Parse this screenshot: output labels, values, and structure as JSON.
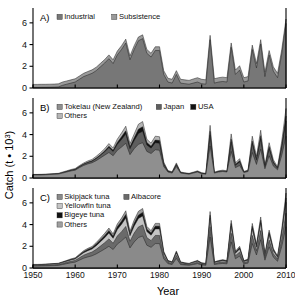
{
  "figure": {
    "xlabel": "Year",
    "ylabel": "Catch (t • 10³)",
    "ylabel_base": "Catch (t • 10",
    "ylabel_sup": "3",
    "ylabel_close": ")",
    "xticks": [
      "1950",
      "1960",
      "1970",
      "1980",
      "1990",
      "2000",
      "2010"
    ],
    "yticks": [
      "0",
      "2",
      "4",
      "6"
    ],
    "xlim": [
      1950,
      2010
    ],
    "ylim": [
      0,
      7
    ],
    "panel_labels": [
      "A)",
      "B)",
      "C)"
    ]
  },
  "colors": {
    "dark": "#111111",
    "mid_dark": "#555555",
    "mid": "#777777",
    "mid_light": "#9a9a9a",
    "light": "#bfbfbf",
    "lighter": "#d8d8d8",
    "axis": "#000000",
    "background": "#ffffff"
  },
  "chart_data": [
    {
      "type": "area",
      "panel": "A)",
      "title": "",
      "xlabel": "Year",
      "ylabel": "Catch (t • 10³)",
      "xlim": [
        1950,
        2010
      ],
      "ylim": [
        0,
        7
      ],
      "stacked": true,
      "grid": false,
      "legend_position": "top-left",
      "legend": [
        "Industrial",
        "Subsistence"
      ],
      "x": [
        1950,
        1951,
        1952,
        1953,
        1954,
        1955,
        1956,
        1957,
        1958,
        1959,
        1960,
        1961,
        1962,
        1963,
        1964,
        1965,
        1966,
        1967,
        1968,
        1969,
        1970,
        1971,
        1972,
        1973,
        1974,
        1975,
        1976,
        1977,
        1978,
        1979,
        1980,
        1981,
        1982,
        1983,
        1984,
        1985,
        1986,
        1987,
        1988,
        1989,
        1990,
        1991,
        1992,
        1993,
        1994,
        1995,
        1996,
        1997,
        1998,
        1999,
        2000,
        2001,
        2002,
        2003,
        2004,
        2005,
        2006,
        2007,
        2008,
        2009,
        2010
      ],
      "series": [
        {
          "name": "Industrial",
          "color": "#777777",
          "values": [
            0.05,
            0.05,
            0.06,
            0.06,
            0.07,
            0.08,
            0.1,
            0.25,
            0.35,
            0.45,
            0.55,
            0.8,
            1.05,
            1.2,
            1.35,
            1.6,
            1.95,
            2.3,
            2.7,
            2.25,
            3.05,
            3.55,
            4.15,
            2.6,
            3.55,
            4.35,
            4.55,
            3.2,
            2.85,
            3.45,
            3.45,
            1.25,
            0.55,
            0.45,
            1.25,
            0.45,
            0.4,
            0.35,
            0.45,
            0.55,
            0.4,
            0.35,
            4.45,
            0.45,
            0.55,
            0.6,
            0.55,
            3.75,
            1.25,
            1.65,
            0.55,
            0.65,
            3.55,
            1.85,
            4.05,
            1.05,
            3.05,
            1.55,
            0.95,
            3.15,
            5.95
          ]
        },
        {
          "name": "Subsistence",
          "color": "#9a9a9a",
          "values": [
            0.28,
            0.28,
            0.28,
            0.28,
            0.28,
            0.28,
            0.28,
            0.3,
            0.3,
            0.3,
            0.3,
            0.3,
            0.3,
            0.32,
            0.32,
            0.32,
            0.32,
            0.32,
            0.35,
            0.35,
            0.35,
            0.35,
            0.35,
            0.35,
            0.35,
            0.35,
            0.35,
            0.35,
            0.35,
            0.35,
            0.35,
            0.35,
            0.35,
            0.35,
            0.35,
            0.35,
            0.35,
            0.35,
            0.38,
            0.4,
            0.4,
            0.4,
            0.4,
            0.4,
            0.4,
            0.4,
            0.4,
            0.4,
            0.4,
            0.4,
            0.4,
            0.4,
            0.4,
            0.4,
            0.4,
            0.4,
            0.4,
            0.4,
            0.4,
            0.4,
            0.4
          ]
        }
      ]
    },
    {
      "type": "area",
      "panel": "B)",
      "title": "",
      "xlabel": "Year",
      "ylabel": "Catch (t • 10³)",
      "xlim": [
        1950,
        2010
      ],
      "ylim": [
        0,
        7
      ],
      "stacked": true,
      "grid": false,
      "legend_position": "top-left",
      "legend": [
        "Tokelau (New Zealand)",
        "Japan",
        "USA",
        "Others"
      ],
      "x": [
        1950,
        1951,
        1952,
        1953,
        1954,
        1955,
        1956,
        1957,
        1958,
        1959,
        1960,
        1961,
        1962,
        1963,
        1964,
        1965,
        1966,
        1967,
        1968,
        1969,
        1970,
        1971,
        1972,
        1973,
        1974,
        1975,
        1976,
        1977,
        1978,
        1979,
        1980,
        1981,
        1982,
        1983,
        1984,
        1985,
        1986,
        1987,
        1988,
        1989,
        1990,
        1991,
        1992,
        1993,
        1994,
        1995,
        1996,
        1997,
        1998,
        1999,
        2000,
        2001,
        2002,
        2003,
        2004,
        2005,
        2006,
        2007,
        2008,
        2009,
        2010
      ],
      "series": [
        {
          "name": "Tokelau (New Zealand)",
          "color": "#8f8f8f",
          "values": [
            0.28,
            0.28,
            0.28,
            0.3,
            0.32,
            0.34,
            0.36,
            0.45,
            0.55,
            0.65,
            0.72,
            0.95,
            1.15,
            1.3,
            1.4,
            1.6,
            1.85,
            2.1,
            2.35,
            2.05,
            2.55,
            2.85,
            3.2,
            2.15,
            2.7,
            3.1,
            3.25,
            2.45,
            2.25,
            2.6,
            2.55,
            1.05,
            0.55,
            0.45,
            1.05,
            0.45,
            0.4,
            0.35,
            0.45,
            0.55,
            0.4,
            0.35,
            2.95,
            0.45,
            0.55,
            0.6,
            0.55,
            2.45,
            0.95,
            1.15,
            0.5,
            0.6,
            2.35,
            1.25,
            2.65,
            0.85,
            2.05,
            1.1,
            0.75,
            2.1,
            3.85
          ]
        },
        {
          "name": "Japan",
          "color": "#5e5e5e",
          "values": [
            0.02,
            0.02,
            0.02,
            0.02,
            0.02,
            0.02,
            0.02,
            0.04,
            0.05,
            0.06,
            0.07,
            0.09,
            0.11,
            0.13,
            0.15,
            0.2,
            0.25,
            0.32,
            0.45,
            0.4,
            0.55,
            0.7,
            0.85,
            0.55,
            0.75,
            1.0,
            1.05,
            0.6,
            0.5,
            0.65,
            0.65,
            0.2,
            0.06,
            0.05,
            0.16,
            0.04,
            0.03,
            0.03,
            0.03,
            0.04,
            0.03,
            0.03,
            1.0,
            0.03,
            0.04,
            0.04,
            0.04,
            0.85,
            0.22,
            0.33,
            0.04,
            0.05,
            0.8,
            0.4,
            0.95,
            0.15,
            0.65,
            0.3,
            0.14,
            0.7,
            1.4
          ]
        },
        {
          "name": "USA",
          "color": "#111111",
          "values": [
            0.0,
            0.0,
            0.0,
            0.0,
            0.0,
            0.0,
            0.0,
            0.0,
            0.0,
            0.0,
            0.01,
            0.01,
            0.02,
            0.02,
            0.03,
            0.04,
            0.05,
            0.07,
            0.12,
            0.1,
            0.18,
            0.25,
            0.3,
            0.18,
            0.25,
            0.4,
            0.42,
            0.22,
            0.18,
            0.25,
            0.25,
            0.08,
            0.02,
            0.02,
            0.06,
            0.01,
            0.01,
            0.01,
            0.01,
            0.01,
            0.01,
            0.01,
            0.35,
            0.01,
            0.01,
            0.01,
            0.01,
            0.28,
            0.07,
            0.1,
            0.01,
            0.02,
            0.25,
            0.12,
            0.3,
            0.05,
            0.2,
            0.1,
            0.04,
            0.22,
            0.45
          ]
        },
        {
          "name": "Others",
          "color": "#b5b5b5",
          "values": [
            0.03,
            0.03,
            0.04,
            0.04,
            0.04,
            0.05,
            0.05,
            0.06,
            0.06,
            0.07,
            0.07,
            0.09,
            0.1,
            0.12,
            0.13,
            0.16,
            0.18,
            0.21,
            0.25,
            0.22,
            0.3,
            0.35,
            0.42,
            0.28,
            0.35,
            0.45,
            0.48,
            0.3,
            0.28,
            0.35,
            0.35,
            0.15,
            0.06,
            0.05,
            0.12,
            0.05,
            0.04,
            0.04,
            0.05,
            0.06,
            0.05,
            0.04,
            0.55,
            0.05,
            0.06,
            0.07,
            0.06,
            0.48,
            0.15,
            0.2,
            0.06,
            0.07,
            0.45,
            0.22,
            0.5,
            0.12,
            0.35,
            0.18,
            0.1,
            0.38,
            0.7
          ]
        }
      ]
    },
    {
      "type": "area",
      "panel": "C)",
      "title": "",
      "xlabel": "Year",
      "ylabel": "Catch (t • 10³)",
      "xlim": [
        1950,
        2010
      ],
      "ylim": [
        0,
        7
      ],
      "stacked": true,
      "grid": false,
      "legend_position": "top-left",
      "legend": [
        "Skipjack tuna",
        "Albacore",
        "Yellowfin tuna",
        "Bigeye tuna",
        "Others"
      ],
      "x": [
        1950,
        1951,
        1952,
        1953,
        1954,
        1955,
        1956,
        1957,
        1958,
        1959,
        1960,
        1961,
        1962,
        1963,
        1964,
        1965,
        1966,
        1967,
        1968,
        1969,
        1970,
        1971,
        1972,
        1973,
        1974,
        1975,
        1976,
        1977,
        1978,
        1979,
        1980,
        1981,
        1982,
        1983,
        1984,
        1985,
        1986,
        1987,
        1988,
        1989,
        1990,
        1991,
        1992,
        1993,
        1994,
        1995,
        1996,
        1997,
        1998,
        1999,
        2000,
        2001,
        2002,
        2003,
        2004,
        2005,
        2006,
        2007,
        2008,
        2009,
        2010
      ],
      "series": [
        {
          "name": "Skipjack tuna",
          "color": "#8a8a8a",
          "values": [
            0.18,
            0.18,
            0.19,
            0.2,
            0.21,
            0.22,
            0.24,
            0.32,
            0.4,
            0.48,
            0.54,
            0.72,
            0.9,
            1.02,
            1.12,
            1.3,
            1.52,
            1.75,
            2.0,
            1.7,
            2.2,
            2.5,
            2.85,
            1.85,
            2.4,
            2.8,
            2.95,
            2.1,
            1.9,
            2.25,
            2.25,
            0.85,
            0.4,
            0.32,
            0.88,
            0.32,
            0.28,
            0.25,
            0.32,
            0.4,
            0.28,
            0.25,
            2.85,
            0.32,
            0.38,
            0.42,
            0.38,
            2.4,
            0.85,
            1.1,
            0.38,
            0.45,
            2.25,
            1.2,
            2.6,
            0.72,
            1.95,
            1.0,
            0.62,
            2.0,
            3.8
          ]
        },
        {
          "name": "Albacore",
          "color": "#6a6a6a",
          "values": [
            0.06,
            0.06,
            0.06,
            0.07,
            0.07,
            0.08,
            0.08,
            0.1,
            0.12,
            0.14,
            0.16,
            0.22,
            0.28,
            0.32,
            0.35,
            0.42,
            0.5,
            0.58,
            0.68,
            0.58,
            0.75,
            0.85,
            0.98,
            0.62,
            0.82,
            0.98,
            1.02,
            0.7,
            0.62,
            0.75,
            0.75,
            0.28,
            0.12,
            0.1,
            0.28,
            0.1,
            0.08,
            0.07,
            0.1,
            0.12,
            0.08,
            0.07,
            0.95,
            0.1,
            0.12,
            0.14,
            0.12,
            0.8,
            0.28,
            0.36,
            0.12,
            0.15,
            0.75,
            0.4,
            0.85,
            0.22,
            0.62,
            0.32,
            0.2,
            0.65,
            1.25
          ]
        },
        {
          "name": "Yellowfin tuna",
          "color": "#c4c4c4",
          "values": [
            0.05,
            0.05,
            0.05,
            0.05,
            0.06,
            0.06,
            0.06,
            0.08,
            0.1,
            0.12,
            0.13,
            0.18,
            0.22,
            0.26,
            0.28,
            0.34,
            0.4,
            0.46,
            0.54,
            0.46,
            0.6,
            0.68,
            0.78,
            0.5,
            0.65,
            0.78,
            0.82,
            0.56,
            0.5,
            0.6,
            0.6,
            0.22,
            0.1,
            0.08,
            0.22,
            0.08,
            0.06,
            0.06,
            0.08,
            0.1,
            0.06,
            0.06,
            0.76,
            0.08,
            0.1,
            0.11,
            0.1,
            0.64,
            0.22,
            0.29,
            0.1,
            0.12,
            0.6,
            0.32,
            0.68,
            0.18,
            0.5,
            0.26,
            0.16,
            0.52,
            1.0
          ]
        },
        {
          "name": "Bigeye tuna",
          "color": "#111111",
          "values": [
            0.02,
            0.02,
            0.02,
            0.02,
            0.02,
            0.02,
            0.03,
            0.03,
            0.04,
            0.05,
            0.05,
            0.07,
            0.09,
            0.1,
            0.11,
            0.14,
            0.16,
            0.19,
            0.22,
            0.19,
            0.24,
            0.27,
            0.31,
            0.2,
            0.26,
            0.31,
            0.33,
            0.22,
            0.2,
            0.24,
            0.24,
            0.09,
            0.04,
            0.03,
            0.09,
            0.03,
            0.03,
            0.02,
            0.03,
            0.04,
            0.03,
            0.02,
            0.3,
            0.03,
            0.04,
            0.05,
            0.04,
            0.26,
            0.09,
            0.12,
            0.04,
            0.05,
            0.24,
            0.13,
            0.27,
            0.07,
            0.2,
            0.1,
            0.06,
            0.21,
            0.4
          ]
        },
        {
          "name": "Others",
          "color": "#9f9f9f",
          "values": [
            0.02,
            0.02,
            0.02,
            0.02,
            0.03,
            0.03,
            0.03,
            0.04,
            0.04,
            0.05,
            0.06,
            0.08,
            0.1,
            0.11,
            0.12,
            0.15,
            0.18,
            0.21,
            0.24,
            0.21,
            0.27,
            0.3,
            0.35,
            0.22,
            0.29,
            0.35,
            0.36,
            0.25,
            0.22,
            0.27,
            0.27,
            0.1,
            0.04,
            0.04,
            0.1,
            0.04,
            0.03,
            0.03,
            0.04,
            0.04,
            0.03,
            0.03,
            0.34,
            0.04,
            0.04,
            0.05,
            0.04,
            0.29,
            0.1,
            0.13,
            0.04,
            0.05,
            0.27,
            0.14,
            0.3,
            0.08,
            0.22,
            0.11,
            0.07,
            0.23,
            0.45
          ]
        }
      ]
    }
  ]
}
